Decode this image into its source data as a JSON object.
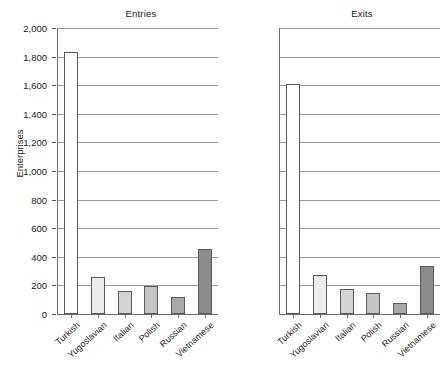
{
  "chart_data": {
    "type": "bar",
    "title": "",
    "panels": [
      {
        "title": "Entries",
        "categories": [
          "Turkish",
          "Yugoslavian",
          "Italian",
          "Polish",
          "Russian",
          "Vietnamese"
        ],
        "values": [
          1835,
          262,
          160,
          198,
          122,
          455
        ]
      },
      {
        "title": "Exits",
        "categories": [
          "Turkish",
          "Yugoslavian",
          "Italian",
          "Polish",
          "Russian",
          "Vietnamese"
        ],
        "values": [
          1610,
          275,
          172,
          150,
          75,
          338
        ]
      }
    ],
    "categories": [
      "Turkish",
      "Yugoslavian",
      "Italian",
      "Polish",
      "Russian",
      "Vietnamese"
    ],
    "series": [
      {
        "name": "Entries",
        "values": [
          1835,
          262,
          160,
          198,
          122,
          455
        ]
      },
      {
        "name": "Exits",
        "values": [
          1610,
          275,
          172,
          150,
          75,
          338
        ]
      }
    ],
    "xlabel": "",
    "ylabel": "Enterprises",
    "ylim": [
      0,
      2000
    ],
    "ytick_values": [
      0,
      200,
      400,
      600,
      800,
      1000,
      1200,
      1400,
      1600,
      1800,
      2000
    ],
    "ytick_labels": [
      "0",
      "200",
      "400",
      "600",
      "800",
      "1,000",
      "1,200",
      "1,400",
      "1,600",
      "1,800",
      "2,000"
    ],
    "grid": true,
    "legend": "none",
    "bar_colors": [
      "#ffffff",
      "#ececec",
      "#d4d4d4",
      "#c4c4c4",
      "#a8a8a8",
      "#8c8c8c"
    ],
    "bar_edge_color": "#5a5a5a",
    "gridline_color": "#9a9a9a",
    "axis_color": "#6b6b6b"
  }
}
